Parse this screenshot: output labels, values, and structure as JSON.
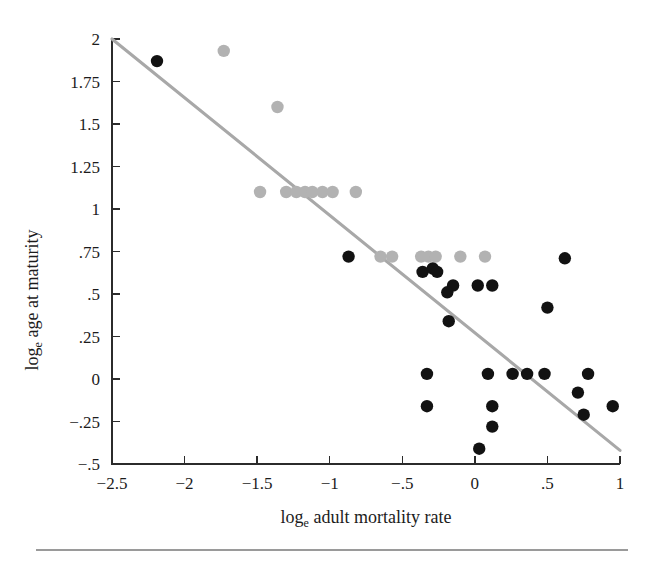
{
  "figure": {
    "background_color": "#ffffff",
    "rule_color": "#9a9a9a"
  },
  "axes": {
    "x_title_main": "log",
    "x_title_sub": "e",
    "x_title_rest": " adult mortality rate",
    "y_title_main": "log",
    "y_title_sub": "e",
    "y_title_rest": " age at maturity",
    "x_ticks": [
      "−2.5",
      "−2",
      "−1.5",
      "−1",
      "−.5",
      "0",
      ".5",
      "1"
    ],
    "y_ticks": [
      "2",
      "1.75",
      "1.5",
      "1.25",
      "1",
      ".75",
      ".5",
      ".25",
      "0",
      "−.25",
      "−.5"
    ]
  },
  "chart_data": {
    "type": "scatter",
    "title": "",
    "xlabel": "log_e adult mortality rate",
    "ylabel": "log_e age at maturity",
    "xlim": [
      -2.5,
      1.0
    ],
    "ylim": [
      -0.5,
      2.0
    ],
    "xticks": [
      -2.5,
      -2,
      -1.5,
      -1,
      -0.5,
      0,
      0.5,
      1
    ],
    "yticks": [
      2,
      1.75,
      1.5,
      1.25,
      1,
      0.75,
      0.5,
      0.25,
      0,
      -0.25,
      -0.5
    ],
    "grid": false,
    "legend": false,
    "series": [
      {
        "name": "gray-group",
        "color": "#b2b2b2",
        "marker": "circle",
        "points": [
          [
            -1.73,
            1.93
          ],
          [
            -1.36,
            1.6
          ],
          [
            -1.48,
            1.1
          ],
          [
            -1.3,
            1.1
          ],
          [
            -1.23,
            1.1
          ],
          [
            -1.17,
            1.1
          ],
          [
            -1.12,
            1.1
          ],
          [
            -1.05,
            1.1
          ],
          [
            -0.98,
            1.1
          ],
          [
            -0.82,
            1.1
          ],
          [
            -0.65,
            0.72
          ],
          [
            -0.57,
            0.72
          ],
          [
            -0.37,
            0.72
          ],
          [
            -0.32,
            0.72
          ],
          [
            -0.27,
            0.72
          ],
          [
            -0.1,
            0.72
          ],
          [
            0.07,
            0.72
          ]
        ]
      },
      {
        "name": "black-group",
        "color": "#121212",
        "marker": "circle",
        "points": [
          [
            -2.19,
            1.87
          ],
          [
            -0.87,
            0.72
          ],
          [
            -0.36,
            0.63
          ],
          [
            -0.29,
            0.65
          ],
          [
            -0.26,
            0.63
          ],
          [
            -0.15,
            0.55
          ],
          [
            -0.19,
            0.51
          ],
          [
            0.02,
            0.55
          ],
          [
            0.12,
            0.55
          ],
          [
            -0.18,
            0.34
          ],
          [
            0.5,
            0.42
          ],
          [
            0.62,
            0.71
          ],
          [
            -0.33,
            0.03
          ],
          [
            0.09,
            0.03
          ],
          [
            0.26,
            0.03
          ],
          [
            0.36,
            0.03
          ],
          [
            0.48,
            0.03
          ],
          [
            0.78,
            0.03
          ],
          [
            -0.33,
            -0.16
          ],
          [
            0.12,
            -0.16
          ],
          [
            0.71,
            -0.08
          ],
          [
            0.75,
            -0.21
          ],
          [
            0.95,
            -0.16
          ],
          [
            0.12,
            -0.28
          ],
          [
            0.03,
            -0.41
          ]
        ]
      }
    ],
    "trendline": {
      "name": "regression-line",
      "color": "#a8a8a8",
      "x_start": -2.5,
      "y_start": 2.0,
      "x_end": 1.0,
      "y_end": -0.42
    }
  }
}
